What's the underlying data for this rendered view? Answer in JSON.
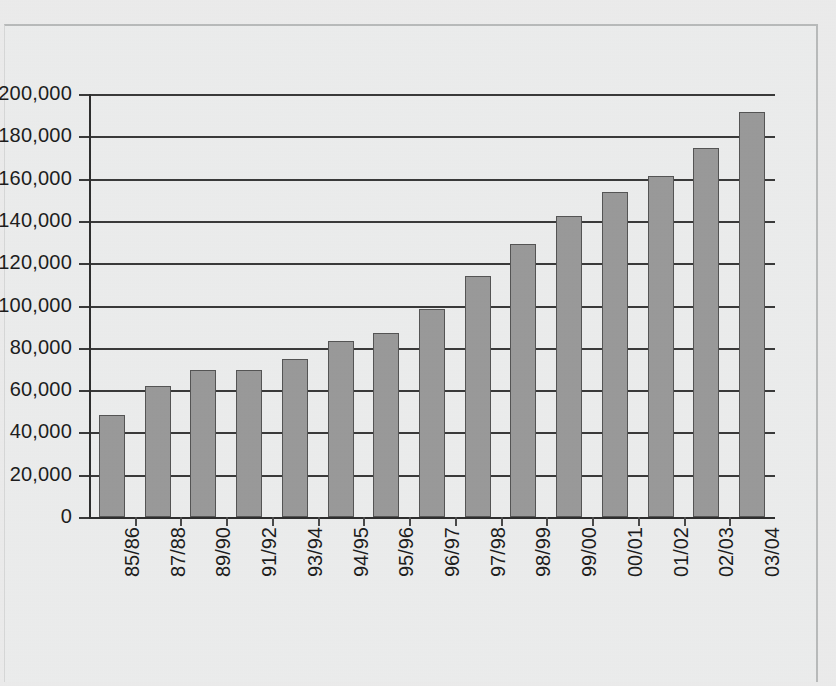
{
  "chart_data": {
    "type": "bar",
    "title": "",
    "subtitle": "",
    "xlabel": "",
    "ylabel": "",
    "categories": [
      "85/86",
      "87/88",
      "89/90",
      "91/92",
      "93/94",
      "94/95",
      "95/96",
      "96/97",
      "97/98",
      "98/99",
      "99/00",
      "00/01",
      "01/02",
      "02/03",
      "03/04"
    ],
    "values": [
      48000,
      62000,
      69500,
      69500,
      74500,
      83000,
      87000,
      98500,
      114000,
      129000,
      142500,
      153500,
      161000,
      174500,
      191500
    ],
    "ylim": [
      0,
      200000
    ],
    "ytick_labels": [
      "200,000",
      "180,000",
      "160,000",
      "140,000",
      "120,000",
      "100,000",
      "80,000",
      "60,000",
      "40,000",
      "20,000",
      "0"
    ],
    "ytick_values": [
      200000,
      180000,
      160000,
      140000,
      120000,
      100000,
      80000,
      60000,
      40000,
      20000,
      0
    ],
    "ytick_step": 20000,
    "grid": true,
    "legend": "none",
    "series_name": "",
    "bar_color": "#9a9a9a",
    "bar_edge_color": "#555555",
    "grid_color": "#3a3a3a",
    "axis_color": "#2e2e2e",
    "background_color": "#eceded"
  }
}
